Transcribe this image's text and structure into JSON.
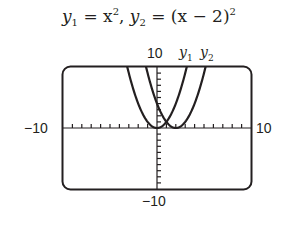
{
  "title": {
    "y1_name": "y",
    "y1_sub": "1",
    "y1_expr": " = x",
    "y1_pow": "2",
    "sep": ",  ",
    "y2_name": "y",
    "y2_sub": "2",
    "y2_expr": " = (x − 2)",
    "y2_pow": "2"
  },
  "labels": {
    "ymax": "10",
    "ymin": "−10",
    "xmin": "−10",
    "xmax": "10",
    "curve1": {
      "name": "y",
      "sub": "1"
    },
    "curve2": {
      "name": "y",
      "sub": "2"
    }
  },
  "colors": {
    "ink": "#231f20",
    "background": "#ffffff"
  },
  "chart_data": {
    "type": "line",
    "xlabel": "",
    "ylabel": "",
    "xlim": [
      -10,
      10
    ],
    "ylim": [
      -10,
      10
    ],
    "xscl": 1,
    "yscl": 1,
    "grid": false,
    "series": [
      {
        "name": "y1",
        "expression": "x^2",
        "x": [
          -3.2,
          -3,
          -2,
          -1,
          0,
          1,
          2,
          3,
          3.2
        ],
        "values": [
          10.24,
          9,
          4,
          1,
          0,
          1,
          4,
          9,
          10.24
        ]
      },
      {
        "name": "y2",
        "expression": "(x-2)^2",
        "x": [
          -1.2,
          -1,
          0,
          1,
          2,
          3,
          4,
          5,
          5.2
        ],
        "values": [
          10.24,
          9,
          4,
          1,
          0,
          1,
          4,
          9,
          10.24
        ]
      }
    ],
    "legend": "labels at top of curves: y1, y2"
  }
}
